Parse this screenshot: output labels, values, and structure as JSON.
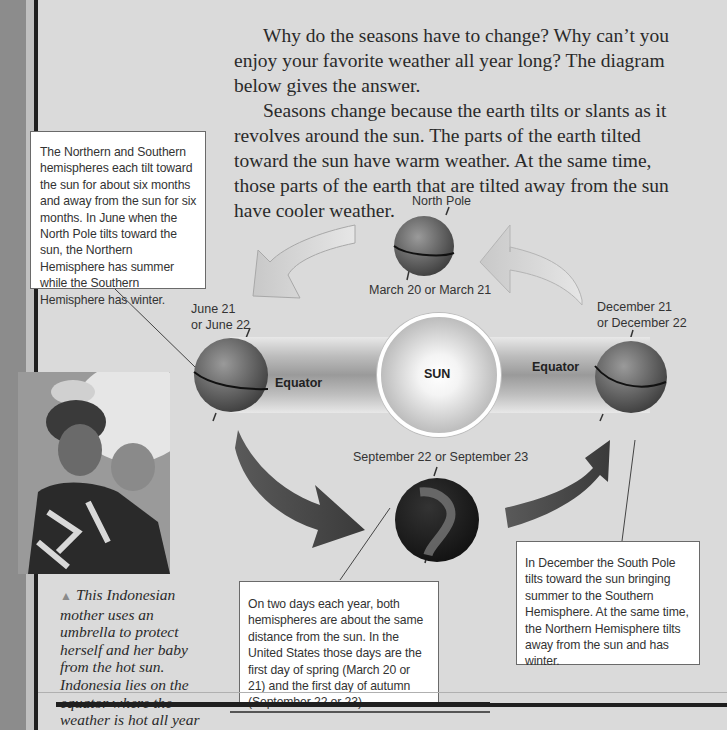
{
  "body_text": {
    "paragraph_1": "Why do the seasons have to change? Why can’t you enjoy your favorite weather all year long? The diagram below gives the answer.",
    "paragraph_2": "Seasons change because the earth tilts or slants as it revolves around the sun. The parts of the earth tilted toward the sun have warm weather. At the same time, those parts of the earth that are tilted away from the sun have cooler weather."
  },
  "diagram": {
    "north_pole_label": "North Pole",
    "march_label": "March 20 or March 21",
    "june_label_line1": "June 21",
    "june_label_line2": "or June 22",
    "december_label_line1": "December 21",
    "december_label_line2": "or December 22",
    "september_label": "September 22 or September 23",
    "sun_label": "SUN",
    "equator_left_label": "Equator",
    "equator_right_label": "Equator"
  },
  "callouts": {
    "northern_southern": "The Northern and Southern hemispheres each tilt toward the sun for about six months and away from the sun for six months. In June when the North Pole tilts toward the sun, the Northern Hemisphere has summer while the Southern Hemisphere has winter.",
    "equinox": "On two days each year, both hemispheres are about the same distance from the sun. In the United States those days are the first day of spring (March 20 or 21) and the first day of autumn (September 22 or 23).",
    "december": "In December the South Pole tilts toward the sun bringing summer to the Southern Hemisphere. At the same time, the Northern Hemisphere tilts away from the sun and has winter."
  },
  "photo": {
    "caption_marker": "▲",
    "caption": "This Indonesian mother uses an umbrella to protect herself and her baby from the hot sun. Indonesia lies on the equator where the weather is hot all year round."
  }
}
